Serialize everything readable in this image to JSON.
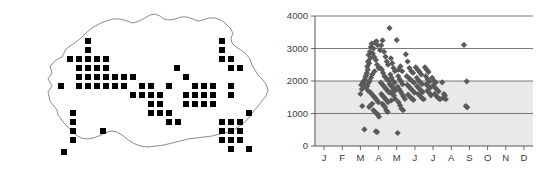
{
  "figure": {
    "panels": [
      {
        "id": "distribution-map",
        "kind": "map",
        "region_name": "Bhutan",
        "symbol": "filled-square",
        "symbol_color": "#000000",
        "outline_color": "#6f6f6f",
        "background_color": "#ffffff"
      },
      {
        "id": "altitude-scatter",
        "kind": "chart"
      }
    ]
  },
  "map_data": {
    "outline_path": "M 57 110 L 50 101 L 48 92 L 52 86 L 48 79 L 52 73 L 50 66 L 56 60 L 62 57 L 66 49 L 73 44 L 80 39 L 86 33 L 92 28 L 99 24 L 106 21 L 113 19 L 120 19 L 127 21 L 133 23 L 139 21 L 145 18 L 150 15 L 155 14 L 160 16 L 164 19 L 169 20 L 175 19 L 181 17 L 187 17 L 193 19 L 198 21 L 203 20 L 209 18 L 215 18 L 221 20 L 226 24 L 230 28 L 233 33 L 231 38 L 232 43 L 236 47 L 241 50 L 246 54 L 250 59 L 252 65 L 255 70 L 258 75 L 262 79 L 266 84 L 268 90 L 266 96 L 262 101 L 258 106 L 254 111 L 250 116 L 246 121 L 241 125 L 235 129 L 228 132 L 220 134 L 212 136 L 204 137 L 196 138 L 188 139 L 180 141 L 172 143 L 164 145 L 156 146 L 148 147 L 140 146 L 133 143 L 127 139 L 122 135 L 117 132 L 111 131 L 105 133 L 99 136 L 93 138 L 87 139 L 81 138 L 76 135 L 72 131 L 68 127 L 64 123 L 61 119 L 58 115 Z",
    "square_size": 6,
    "squares": [
      [
        88,
        41
      ],
      [
        88,
        50
      ],
      [
        88,
        59
      ],
      [
        70,
        59
      ],
      [
        79,
        59
      ],
      [
        97,
        59
      ],
      [
        106,
        59
      ],
      [
        79,
        68
      ],
      [
        88,
        68
      ],
      [
        97,
        68
      ],
      [
        106,
        68
      ],
      [
        79,
        77
      ],
      [
        88,
        77
      ],
      [
        97,
        77
      ],
      [
        106,
        77
      ],
      [
        115,
        77
      ],
      [
        124,
        77
      ],
      [
        133,
        77
      ],
      [
        61,
        86
      ],
      [
        79,
        86
      ],
      [
        88,
        86
      ],
      [
        97,
        86
      ],
      [
        106,
        86
      ],
      [
        115,
        86
      ],
      [
        142,
        86
      ],
      [
        151,
        86
      ],
      [
        124,
        86
      ],
      [
        169,
        86
      ],
      [
        133,
        95
      ],
      [
        142,
        95
      ],
      [
        151,
        95
      ],
      [
        160,
        95
      ],
      [
        169,
        86
      ],
      [
        151,
        104
      ],
      [
        160,
        104
      ],
      [
        151,
        113
      ],
      [
        160,
        113
      ],
      [
        169,
        113
      ],
      [
        169,
        122
      ],
      [
        178,
        122
      ],
      [
        73,
        113
      ],
      [
        73,
        122
      ],
      [
        73,
        131
      ],
      [
        73,
        140
      ],
      [
        64,
        152
      ],
      [
        103,
        131
      ],
      [
        186,
        77
      ],
      [
        195,
        86
      ],
      [
        204,
        86
      ],
      [
        213,
        86
      ],
      [
        186,
        95
      ],
      [
        195,
        95
      ],
      [
        204,
        95
      ],
      [
        213,
        95
      ],
      [
        177,
        68
      ],
      [
        222,
        59
      ],
      [
        231,
        59
      ],
      [
        231,
        68
      ],
      [
        240,
        68
      ],
      [
        222,
        41
      ],
      [
        222,
        50
      ],
      [
        231,
        86
      ],
      [
        231,
        95
      ],
      [
        222,
        122
      ],
      [
        231,
        122
      ],
      [
        240,
        122
      ],
      [
        222,
        131
      ],
      [
        231,
        131
      ],
      [
        240,
        131
      ],
      [
        222,
        140
      ],
      [
        231,
        140
      ],
      [
        240,
        140
      ],
      [
        249,
        113
      ],
      [
        249,
        149
      ],
      [
        231,
        149
      ],
      [
        204,
        104
      ],
      [
        213,
        104
      ],
      [
        195,
        104
      ],
      [
        186,
        104
      ]
    ]
  },
  "chart_data": {
    "type": "scatter",
    "title": "",
    "xlabel": "",
    "ylabel": "",
    "xlim": [
      0,
      12
    ],
    "ylim": [
      0,
      4000
    ],
    "x_tick_labels": [
      "J",
      "F",
      "M",
      "A",
      "M",
      "J",
      "J",
      "A",
      "S",
      "O",
      "N",
      "D"
    ],
    "x_tick_values": [
      0.5,
      1.5,
      2.5,
      3.5,
      4.5,
      5.5,
      6.5,
      7.5,
      8.5,
      9.5,
      10.5,
      11.5
    ],
    "y_tick_labels": [
      "0",
      "1000",
      "2000",
      "3000",
      "4000"
    ],
    "y_tick_values": [
      0,
      1000,
      2000,
      3000,
      4000
    ],
    "grid": "horizontal",
    "grid_values": [
      1000,
      2000,
      3000,
      4000
    ],
    "legend": "none",
    "point_color": "#5a5a5a",
    "point_marker": "diamond",
    "shaded_band": [
      0,
      2000
    ],
    "shaded_band_color": "#e9e9e9",
    "points": [
      [
        2.62,
        1950
      ],
      [
        2.7,
        2010
      ],
      [
        2.55,
        1880
      ],
      [
        2.78,
        2120
      ],
      [
        2.6,
        1230
      ],
      [
        2.85,
        2250
      ],
      [
        2.92,
        2600
      ],
      [
        2.88,
        2450
      ],
      [
        2.95,
        2800
      ],
      [
        3.02,
        2900
      ],
      [
        3.08,
        3050
      ],
      [
        3.12,
        3150
      ],
      [
        3.05,
        2700
      ],
      [
        2.98,
        2550
      ],
      [
        2.9,
        2350
      ],
      [
        2.82,
        2180
      ],
      [
        2.75,
        2050
      ],
      [
        2.68,
        1900
      ],
      [
        2.58,
        1750
      ],
      [
        2.5,
        1600
      ],
      [
        2.72,
        510
      ],
      [
        3.3,
        3180
      ],
      [
        3.38,
        3220
      ],
      [
        3.45,
        3100
      ],
      [
        3.22,
        3000
      ],
      [
        3.18,
        2850
      ],
      [
        3.25,
        2750
      ],
      [
        3.35,
        2650
      ],
      [
        3.42,
        2500
      ],
      [
        3.5,
        2400
      ],
      [
        3.28,
        2300
      ],
      [
        3.15,
        2200
      ],
      [
        3.08,
        2100
      ],
      [
        3.0,
        2000
      ],
      [
        2.95,
        1950
      ],
      [
        2.88,
        1850
      ],
      [
        2.8,
        1800
      ],
      [
        2.92,
        1700
      ],
      [
        3.05,
        1650
      ],
      [
        3.12,
        1600
      ],
      [
        3.2,
        1550
      ],
      [
        3.28,
        1500
      ],
      [
        3.35,
        1450
      ],
      [
        3.42,
        1400
      ],
      [
        3.48,
        1350
      ],
      [
        3.15,
        1300
      ],
      [
        3.05,
        1250
      ],
      [
        2.98,
        1200
      ],
      [
        3.22,
        1100
      ],
      [
        3.3,
        1050
      ],
      [
        3.38,
        1000
      ],
      [
        3.45,
        980
      ],
      [
        3.52,
        900
      ],
      [
        3.35,
        450
      ],
      [
        3.42,
        430
      ],
      [
        3.58,
        2950
      ],
      [
        3.65,
        3100
      ],
      [
        3.72,
        3250
      ],
      [
        3.8,
        2900
      ],
      [
        3.88,
        2750
      ],
      [
        3.95,
        2600
      ],
      [
        4.02,
        2500
      ],
      [
        3.6,
        2400
      ],
      [
        3.68,
        2350
      ],
      [
        3.75,
        2250
      ],
      [
        3.82,
        2150
      ],
      [
        3.9,
        2100
      ],
      [
        3.98,
        2050
      ],
      [
        4.05,
        2000
      ],
      [
        3.62,
        1950
      ],
      [
        3.7,
        1900
      ],
      [
        3.78,
        1850
      ],
      [
        3.85,
        1800
      ],
      [
        3.92,
        1750
      ],
      [
        4.0,
        1700
      ],
      [
        4.08,
        1650
      ],
      [
        3.65,
        1600
      ],
      [
        3.72,
        1550
      ],
      [
        3.8,
        1500
      ],
      [
        3.88,
        1450
      ],
      [
        3.95,
        1400
      ],
      [
        4.02,
        1350
      ],
      [
        3.7,
        1300
      ],
      [
        3.78,
        1250
      ],
      [
        3.85,
        1200
      ],
      [
        3.92,
        1100
      ],
      [
        4.0,
        1050
      ],
      [
        4.1,
        3630
      ],
      [
        4.18,
        2700
      ],
      [
        4.25,
        2550
      ],
      [
        4.32,
        2400
      ],
      [
        4.4,
        2300
      ],
      [
        4.15,
        2200
      ],
      [
        4.22,
        2100
      ],
      [
        4.3,
        2000
      ],
      [
        4.38,
        1950
      ],
      [
        4.12,
        1900
      ],
      [
        4.2,
        1850
      ],
      [
        4.28,
        1800
      ],
      [
        4.35,
        1750
      ],
      [
        4.42,
        1700
      ],
      [
        4.18,
        1650
      ],
      [
        4.26,
        1600
      ],
      [
        4.34,
        1550
      ],
      [
        4.42,
        1450
      ],
      [
        4.2,
        1400
      ],
      [
        4.5,
        3260
      ],
      [
        4.6,
        2350
      ],
      [
        4.7,
        2450
      ],
      [
        4.8,
        2300
      ],
      [
        4.58,
        2150
      ],
      [
        4.66,
        2050
      ],
      [
        4.74,
        1980
      ],
      [
        4.82,
        1900
      ],
      [
        4.55,
        1820
      ],
      [
        4.63,
        1750
      ],
      [
        4.71,
        1680
      ],
      [
        4.79,
        1600
      ],
      [
        4.87,
        1520
      ],
      [
        4.95,
        1450
      ],
      [
        4.6,
        1350
      ],
      [
        4.68,
        1250
      ],
      [
        4.76,
        1150
      ],
      [
        4.85,
        1100
      ],
      [
        4.55,
        400
      ],
      [
        5.0,
        2820
      ],
      [
        5.1,
        2600
      ],
      [
        5.2,
        2400
      ],
      [
        5.3,
        2300
      ],
      [
        5.4,
        2250
      ],
      [
        5.05,
        2150
      ],
      [
        5.15,
        2100
      ],
      [
        5.25,
        2050
      ],
      [
        5.35,
        2000
      ],
      [
        5.45,
        1950
      ],
      [
        5.08,
        1880
      ],
      [
        5.18,
        1820
      ],
      [
        5.28,
        1760
      ],
      [
        5.38,
        1700
      ],
      [
        5.48,
        1640
      ],
      [
        5.12,
        1580
      ],
      [
        5.22,
        1520
      ],
      [
        5.32,
        1460
      ],
      [
        5.42,
        1420
      ],
      [
        5.55,
        2420
      ],
      [
        5.65,
        2350
      ],
      [
        5.75,
        2280
      ],
      [
        5.85,
        2200
      ],
      [
        5.6,
        2100
      ],
      [
        5.7,
        2020
      ],
      [
        5.8,
        1960
      ],
      [
        5.9,
        1900
      ],
      [
        5.62,
        1840
      ],
      [
        5.72,
        1780
      ],
      [
        5.82,
        1720
      ],
      [
        5.92,
        1660
      ],
      [
        5.68,
        1600
      ],
      [
        5.78,
        1540
      ],
      [
        5.88,
        1480
      ],
      [
        5.98,
        1440
      ],
      [
        6.05,
        2420
      ],
      [
        6.15,
        2350
      ],
      [
        6.25,
        2280
      ],
      [
        6.1,
        2150
      ],
      [
        6.2,
        2050
      ],
      [
        6.3,
        1980
      ],
      [
        6.12,
        1900
      ],
      [
        6.22,
        1840
      ],
      [
        6.32,
        1780
      ],
      [
        6.18,
        1700
      ],
      [
        6.28,
        1640
      ],
      [
        6.38,
        1560
      ],
      [
        6.45,
        2100
      ],
      [
        6.55,
        2000
      ],
      [
        6.65,
        1960
      ],
      [
        6.5,
        1860
      ],
      [
        6.6,
        1800
      ],
      [
        6.7,
        1740
      ],
      [
        6.8,
        1680
      ],
      [
        6.58,
        1600
      ],
      [
        6.68,
        1540
      ],
      [
        6.78,
        1480
      ],
      [
        6.88,
        1440
      ],
      [
        7.0,
        1960
      ],
      [
        7.1,
        1600
      ],
      [
        7.15,
        1550
      ],
      [
        7.05,
        1480
      ],
      [
        7.2,
        1440
      ],
      [
        8.2,
        3110
      ],
      [
        8.35,
        1990
      ],
      [
        8.3,
        1230
      ],
      [
        8.38,
        1190
      ]
    ]
  }
}
